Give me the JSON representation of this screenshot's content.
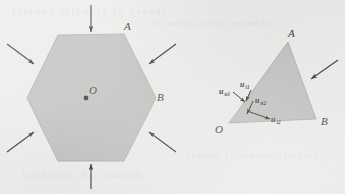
{
  "figure": {
    "background_color": "#e9e9e7",
    "ink_color": "#1a1a1a",
    "shape_fill_color": "#b7b7b5",
    "shape_stroke_color": "#8f8f8d"
  },
  "panels": [
    {
      "id": "hexagon-panel",
      "name": "hexagonal-particle-under-compression",
      "shape": "hexagon",
      "center_marker": {
        "label": "O",
        "x": 86,
        "y": 98
      },
      "vertex_labels": [
        {
          "label": "A",
          "x": 124,
          "y": 33
        },
        {
          "label": "B",
          "x": 156,
          "y": 98
        }
      ],
      "load_arrow_count": 6
    },
    {
      "id": "triangle-panel",
      "name": "triangular-particle-contact-vectors",
      "shape": "triangle",
      "vertex_labels": [
        {
          "label": "A",
          "x": 292,
          "y": 35
        },
        {
          "label": "B",
          "x": 322,
          "y": 122
        },
        {
          "label": "O",
          "x": 221,
          "y": 129
        }
      ],
      "load_arrow_count": 1,
      "vectors": [
        {
          "base": "u",
          "sub": "n1",
          "x": 225,
          "y": 92
        },
        {
          "base": "u",
          "sub": "t1",
          "x": 245,
          "y": 85
        },
        {
          "base": "u",
          "sub": "n2",
          "x": 259,
          "y": 101
        },
        {
          "base": "u",
          "sub": "t2",
          "x": 276,
          "y": 118
        }
      ]
    }
  ],
  "ghost_text_lines": [
    "theory of granular contact",
    "element simulation of",
    "particle assembly model",
    "normal and tangential"
  ]
}
